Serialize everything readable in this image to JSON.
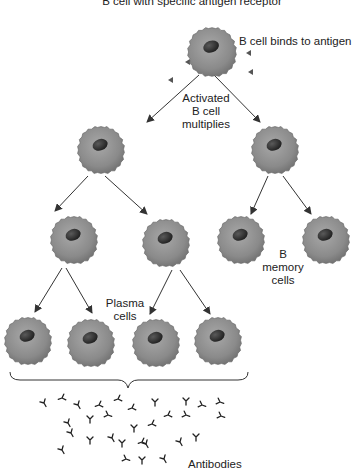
{
  "title": "B cell with specific antigen receptor",
  "labels": {
    "binds": "B cell binds to antigen",
    "activated": [
      "Activated",
      "B cell",
      "multiplies"
    ],
    "memory": [
      "B",
      "memory",
      "cells"
    ],
    "plasma": [
      "Plasma",
      "cells"
    ],
    "antibodies": "Antibodies"
  },
  "colors": {
    "cell_fill": "#8c8c8c",
    "cell_edge": "#6e6e6e",
    "nucleus": "#2a2a2a",
    "arrow": "#333333",
    "text": "#222222"
  },
  "cells": [
    {
      "id": "root",
      "x": 212,
      "y": 52,
      "r": 27
    },
    {
      "id": "gen1-left",
      "x": 101,
      "y": 150,
      "r": 26
    },
    {
      "id": "gen1-right",
      "x": 275,
      "y": 150,
      "r": 26
    },
    {
      "id": "gen2-left",
      "x": 74,
      "y": 240,
      "r": 26
    },
    {
      "id": "gen2-mid",
      "x": 166,
      "y": 243,
      "r": 26
    },
    {
      "id": "memory-1",
      "x": 241,
      "y": 240,
      "r": 26
    },
    {
      "id": "memory-2",
      "x": 326,
      "y": 240,
      "r": 26
    },
    {
      "id": "plasma-1",
      "x": 28,
      "y": 341,
      "r": 26
    },
    {
      "id": "plasma-2",
      "x": 91,
      "y": 343,
      "r": 26
    },
    {
      "id": "plasma-3",
      "x": 156,
      "y": 343,
      "r": 26
    },
    {
      "id": "plasma-4",
      "x": 218,
      "y": 341,
      "r": 26
    }
  ]
}
